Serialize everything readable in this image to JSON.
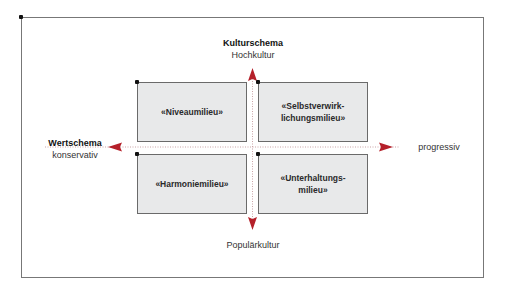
{
  "diagram": {
    "axes": {
      "vertical": {
        "title": "Kulturschema",
        "top_label": "Hochkultur",
        "bottom_label": "Populärkultur"
      },
      "horizontal": {
        "title": "Wertschema",
        "left_label": "konservativ",
        "right_label": "progressiv"
      },
      "arrow_color": "#b5202a",
      "line_color": "#c9a3a6"
    },
    "quadrants": [
      {
        "id": "top-left",
        "label": "«Niveaumilieu»"
      },
      {
        "id": "top-right",
        "label": "«Selbstverwirk-\nlichungsmilieu»"
      },
      {
        "id": "bottom-left",
        "label": "«Harmoniemilieu»"
      },
      {
        "id": "bottom-right",
        "label": "«Unterhaltungs-\nmilieu»"
      }
    ],
    "box_fill": "#e8e9ea"
  }
}
